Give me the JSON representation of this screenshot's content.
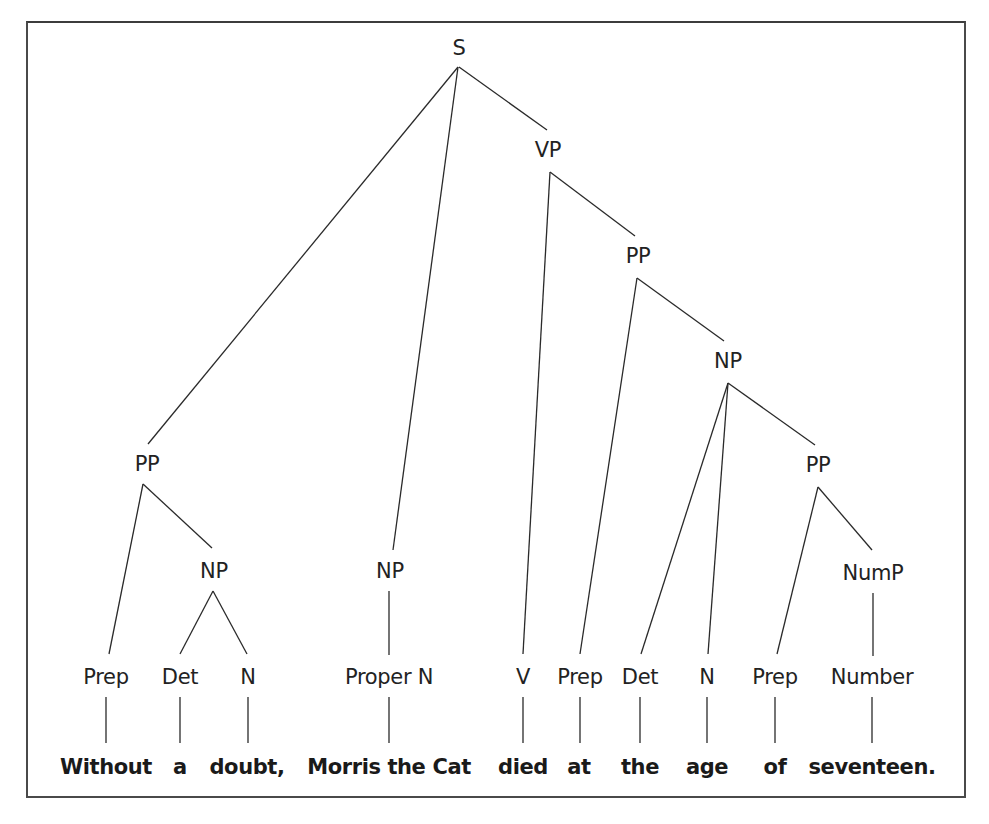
{
  "diagram": {
    "type": "syntax-tree",
    "sentence": "Without a doubt, Morris the Cat died at the age of seventeen.",
    "nodes": {
      "s": {
        "label": "S",
        "x": 459,
        "y": 48
      },
      "vp": {
        "label": "VP",
        "x": 548,
        "y": 150
      },
      "pp_vp": {
        "label": "PP",
        "x": 638,
        "y": 256
      },
      "np_obj": {
        "label": "NP",
        "x": 728,
        "y": 361
      },
      "pp_adv": {
        "label": "PP",
        "x": 147,
        "y": 464
      },
      "pp_of": {
        "label": "PP",
        "x": 818,
        "y": 465
      },
      "np_doubt": {
        "label": "NP",
        "x": 214,
        "y": 571
      },
      "np_subj": {
        "label": "NP",
        "x": 390,
        "y": 571
      },
      "nump": {
        "label": "NumP",
        "x": 873,
        "y": 573
      }
    },
    "pos": [
      {
        "label": "Prep",
        "x": 106
      },
      {
        "label": "Det",
        "x": 180
      },
      {
        "label": "N",
        "x": 248
      },
      {
        "label": "Proper N",
        "x": 389
      },
      {
        "label": "V",
        "x": 523
      },
      {
        "label": "Prep",
        "x": 580
      },
      {
        "label": "Det",
        "x": 640
      },
      {
        "label": "N",
        "x": 707
      },
      {
        "label": "Prep",
        "x": 775
      },
      {
        "label": "Number",
        "x": 872
      }
    ],
    "words": [
      {
        "text": "Without",
        "x": 106
      },
      {
        "text": "a",
        "x": 180
      },
      {
        "text": "doubt,",
        "x": 247
      },
      {
        "text": "Morris the Cat",
        "x": 389
      },
      {
        "text": "died",
        "x": 523
      },
      {
        "text": "at",
        "x": 579
      },
      {
        "text": "the",
        "x": 640
      },
      {
        "text": "age",
        "x": 707
      },
      {
        "text": "of",
        "x": 775
      },
      {
        "text": "seventeen.",
        "x": 872
      }
    ],
    "edges": [
      {
        "from": "S",
        "to": "PP (adverbial)",
        "x1": 458,
        "y1": 67,
        "x2": 148,
        "y2": 444
      },
      {
        "from": "S",
        "to": "NP (subject)",
        "x1": 458,
        "y1": 67,
        "x2": 393,
        "y2": 550
      },
      {
        "from": "S",
        "to": "VP",
        "x1": 459,
        "y1": 67,
        "x2": 547,
        "y2": 130
      },
      {
        "from": "VP",
        "to": "V",
        "x1": 550,
        "y1": 172,
        "x2": 523,
        "y2": 654
      },
      {
        "from": "VP",
        "to": "PP",
        "x1": 550,
        "y1": 172,
        "x2": 635,
        "y2": 236
      },
      {
        "from": "PP",
        "to": "Prep",
        "x1": 637,
        "y1": 278,
        "x2": 580,
        "y2": 654
      },
      {
        "from": "PP",
        "to": "NP",
        "x1": 637,
        "y1": 278,
        "x2": 724,
        "y2": 341
      },
      {
        "from": "NP",
        "to": "Det",
        "x1": 728,
        "y1": 383,
        "x2": 641,
        "y2": 654
      },
      {
        "from": "NP",
        "to": "N",
        "x1": 728,
        "y1": 383,
        "x2": 708,
        "y2": 654
      },
      {
        "from": "NP",
        "to": "PP (of)",
        "x1": 728,
        "y1": 383,
        "x2": 815,
        "y2": 445
      },
      {
        "from": "PP (of)",
        "to": "Prep",
        "x1": 818,
        "y1": 487,
        "x2": 777,
        "y2": 654
      },
      {
        "from": "PP (of)",
        "to": "NumP",
        "x1": 818,
        "y1": 487,
        "x2": 872,
        "y2": 550
      },
      {
        "from": "NumP",
        "to": "Number",
        "x1": 873,
        "y1": 593,
        "x2": 873,
        "y2": 656
      },
      {
        "from": "PP (adverbial)",
        "to": "Prep",
        "x1": 143,
        "y1": 484,
        "x2": 109,
        "y2": 654
      },
      {
        "from": "PP (adverbial)",
        "to": "NP",
        "x1": 143,
        "y1": 484,
        "x2": 212,
        "y2": 548
      },
      {
        "from": "NP (doubt)",
        "to": "Det",
        "x1": 213,
        "y1": 591,
        "x2": 180,
        "y2": 654
      },
      {
        "from": "NP (doubt)",
        "to": "N",
        "x1": 213,
        "y1": 591,
        "x2": 247,
        "y2": 654
      },
      {
        "from": "NP (subject)",
        "to": "Proper N",
        "x1": 389,
        "y1": 591,
        "x2": 389,
        "y2": 655
      }
    ],
    "pos_row_y": 677,
    "word_row_y": 767,
    "leaf_line_top": 697,
    "leaf_line_bottom": 743
  }
}
